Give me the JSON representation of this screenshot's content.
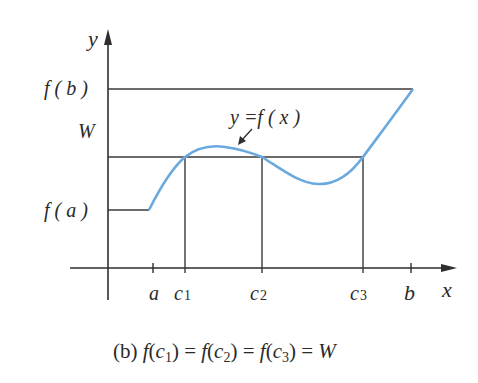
{
  "diagram": {
    "axes": {
      "x_label": "x",
      "y_label": "y"
    },
    "y_labels": {
      "fb": "f ( b )",
      "w": "W",
      "fa": "f ( a )"
    },
    "x_labels": {
      "a": "a",
      "c1": "c",
      "c1_sub": "1",
      "c2": "c",
      "c2_sub": "2",
      "c3": "c",
      "c3_sub": "3",
      "b": "b"
    },
    "curve_label": "y =f ( x )",
    "curve_color": "#6aa9de",
    "line_color": "#3a3a3a",
    "caption": {
      "prefix": "(b) ",
      "parts": [
        {
          "f": "f",
          "c": "c",
          "sub": "1"
        },
        {
          "f": "f",
          "c": "c",
          "sub": "2"
        },
        {
          "f": "f",
          "c": "c",
          "sub": "3"
        }
      ],
      "result": "W",
      "text": "(b) f(c1) = f(c2) = f(c3) = W"
    }
  }
}
